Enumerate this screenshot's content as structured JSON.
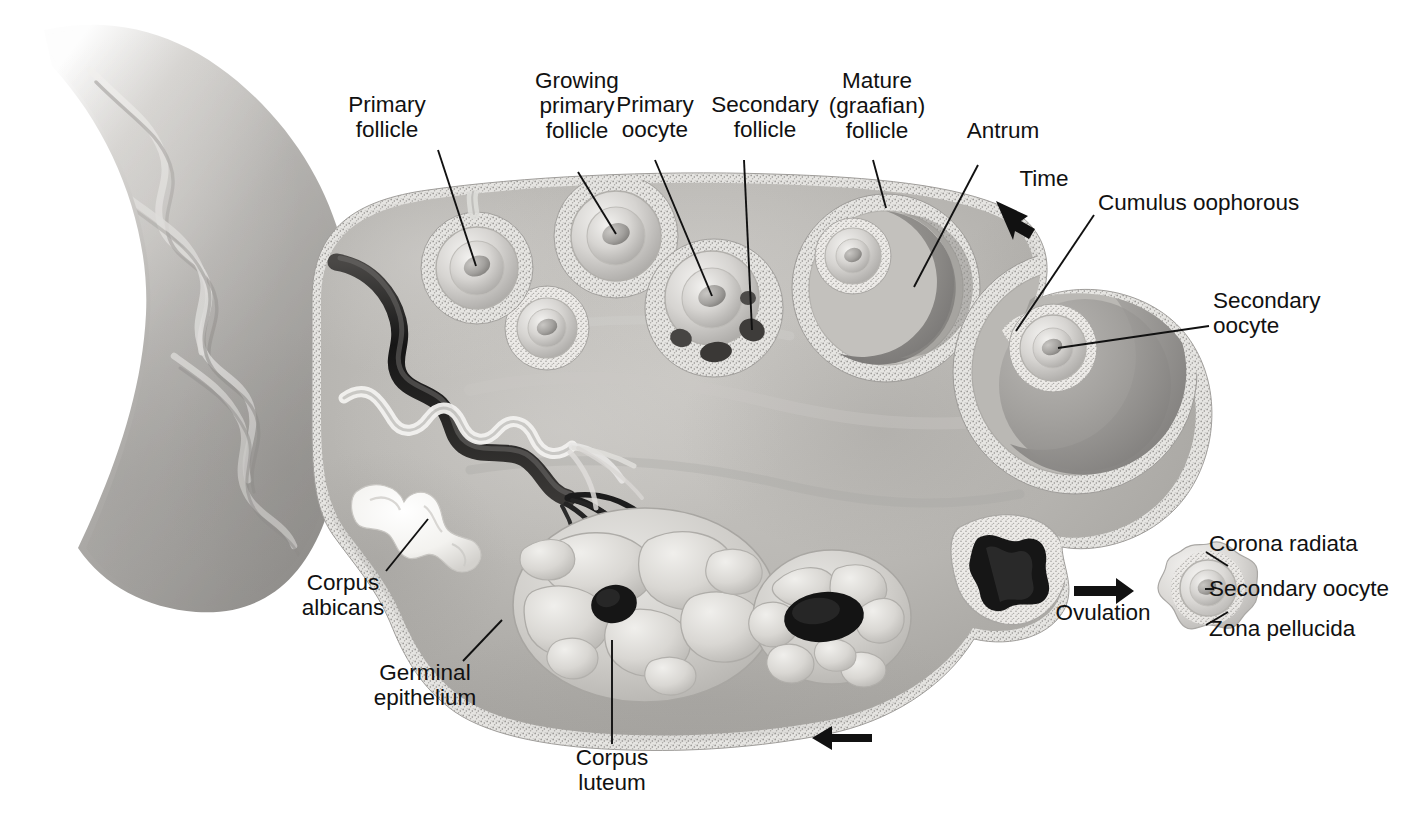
{
  "figure": {
    "kind": "anatomical-illustration",
    "style": "grayscale medical airbrush illustration"
  },
  "labels": {
    "primary_follicle": "Primary\nfollicle",
    "growing_primary_follicle": "Growing\nprimary\nfollicle",
    "primary_oocyte": "Primary\noocyte",
    "secondary_follicle": "Secondary\nfollicle",
    "mature_graafian_follicle": "Mature\n(graafian)\nfollicle",
    "antrum": "Antrum",
    "time": "Time",
    "cumulus_oophorous": "Cumulus oophorous",
    "secondary_oocyte_big": "Secondary\noocyte",
    "corpus_albicans": "Corpus\nalbicans",
    "germinal_epithelium": "Germinal\nepithelium",
    "corpus_luteum": "Corpus\nluteum",
    "ovulation": "Ovulation",
    "corona_radiata": "Corona radiata",
    "secondary_oocyte_released": "Secondary oocyte",
    "zona_pellucida": "Zona pellucida"
  },
  "colors": {
    "ink": "#111111",
    "background": "#ffffff",
    "stroma_light": "#c9c7c4",
    "stroma_mid": "#b0aeab",
    "stroma_dark": "#8e8c89",
    "cortex": "#bcbab7",
    "epithelium": "#e8e7e4",
    "granulosa": "#ddddda",
    "antrum_fluid": "#908e8b",
    "oocyte": "#d8d7d4",
    "corpus_luteum": "#cfcdc9",
    "cavity_dark": "#2a2a2a",
    "vessel_dark": "#1d1d1d",
    "corpus_albicans": "#f2f1ee",
    "tube": "#b7b5b2"
  },
  "structures": [
    {
      "name": "ovarian-ligament-tube",
      "note": "Broad tapering band entering from upper-left"
    },
    {
      "name": "ovary-body",
      "note": "Large ovoid cross-section occupying center"
    },
    {
      "name": "germinal-epithelium-layer",
      "note": "Speckled pale rim around the whole ovary"
    },
    {
      "name": "blood-vessel",
      "note": "Dark wavy vessel in the hilum region"
    },
    {
      "name": "lymphatic-vessel",
      "note": "Pale wavy vessel below the dark vessel"
    },
    {
      "name": "primordial-follicle",
      "note": "Small follicle below primary follicle"
    },
    {
      "name": "primary-follicle",
      "note": "Follicle with single layer, upper left of cortex"
    },
    {
      "name": "growing-primary-follicle",
      "note": "Larger multilayer follicle"
    },
    {
      "name": "secondary-follicle",
      "note": "Follicle with small coalescing antral spaces"
    },
    {
      "name": "mature-graafian-follicle",
      "note": "Large follicle with crescent antrum"
    },
    {
      "name": "large-graafian-follicle",
      "note": "Largest follicle bulging from the right pole"
    },
    {
      "name": "ruptured-follicle",
      "note": "Star-shaped dark collapsed follicle near ovulation site"
    },
    {
      "name": "corpus-luteum-early",
      "note": "Lobed yellow body at lower right of the cluster"
    },
    {
      "name": "corpus-luteum-mature",
      "note": "Large lobulated corpus luteum at bottom center"
    },
    {
      "name": "corpus-albicans",
      "note": "Bright white scar tissue at left"
    },
    {
      "name": "ovulated-oocyte",
      "note": "Free secondary oocyte outside the ovary at right"
    }
  ],
  "arrows": [
    {
      "name": "time-arrow",
      "direction": "down-right",
      "caption": "Time"
    },
    {
      "name": "ovulation-arrow",
      "direction": "right",
      "caption": "Ovulation"
    },
    {
      "name": "cycle-return-arrow",
      "direction": "left",
      "caption": ""
    }
  ]
}
